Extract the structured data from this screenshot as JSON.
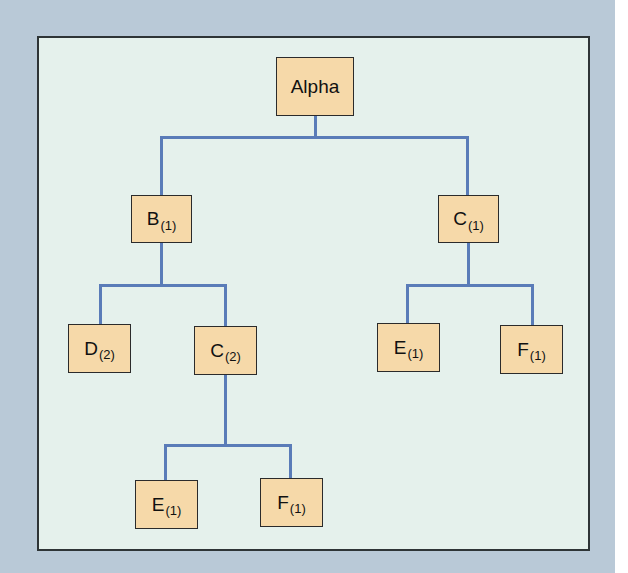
{
  "diagram": {
    "type": "tree",
    "colors": {
      "backdrop": "#b9c9d7",
      "panel": "#e5f1ec",
      "node_fill": "#f6d9a9",
      "node_border": "#2b2b2b",
      "edge": "#5a7cb8"
    },
    "nodes": {
      "root": {
        "label": "Alpha",
        "sub": ""
      },
      "b1": {
        "label": "B",
        "sub": "(1)"
      },
      "c1": {
        "label": "C",
        "sub": "(1)"
      },
      "d2": {
        "label": "D",
        "sub": "(2)"
      },
      "c2": {
        "label": "C",
        "sub": "(2)"
      },
      "e1_right": {
        "label": "E",
        "sub": "(1)"
      },
      "f1_right": {
        "label": "F",
        "sub": "(1)"
      },
      "e1_bottom": {
        "label": "E",
        "sub": "(1)"
      },
      "f1_bottom": {
        "label": "F",
        "sub": "(1)"
      }
    },
    "edges": [
      [
        "root",
        "b1"
      ],
      [
        "root",
        "c1"
      ],
      [
        "b1",
        "d2"
      ],
      [
        "b1",
        "c2"
      ],
      [
        "c1",
        "e1_right"
      ],
      [
        "c1",
        "f1_right"
      ],
      [
        "c2",
        "e1_bottom"
      ],
      [
        "c2",
        "f1_bottom"
      ]
    ]
  }
}
